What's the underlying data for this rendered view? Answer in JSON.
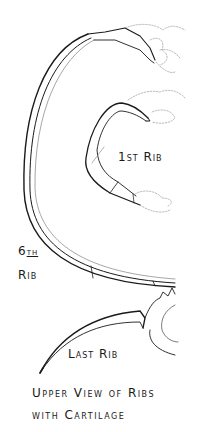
{
  "figure": {
    "type": "anatomical line illustration",
    "labels": {
      "first_rib": "1st Rib",
      "sixth_rib_num": "6",
      "sixth_rib_suffix": "th",
      "sixth_rib_word": "Rib",
      "last_rib": "Last Rib"
    },
    "caption": {
      "line1": "Upper View of Ribs",
      "line2": "with Cartilage"
    },
    "colors": {
      "ink": "#1a1a1a",
      "faint_ink": "#8a8a8a",
      "background": "#ffffff"
    }
  }
}
